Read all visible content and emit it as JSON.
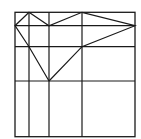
{
  "diagram": {
    "type": "geometric-grid-with-polygon",
    "stroke_color": "#1a1a1a",
    "background": "#ffffff",
    "frame": {
      "x": 15,
      "y": 12.3,
      "width": 120,
      "height": 124.4
    },
    "vertical_lines_x": [
      29,
      49,
      82
    ],
    "horizontal_lines_y": [
      25.7,
      46.7,
      81
    ],
    "polygon_points": [
      [
        49,
        81
      ],
      [
        29,
        46.7
      ],
      [
        15,
        25.7
      ],
      [
        29,
        12.3
      ],
      [
        49,
        25.7
      ],
      [
        82,
        12.3
      ],
      [
        135,
        25.7
      ],
      [
        82,
        46.7
      ],
      [
        49,
        81
      ]
    ]
  }
}
